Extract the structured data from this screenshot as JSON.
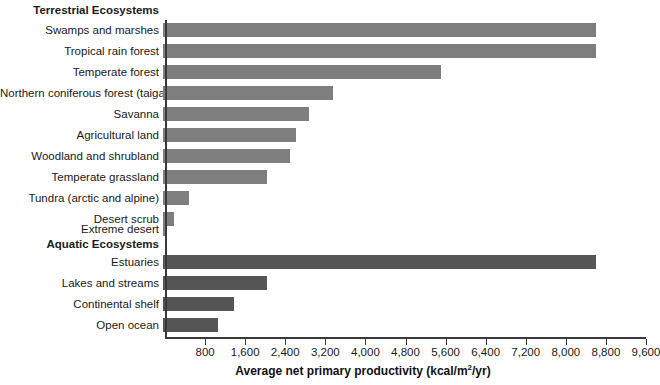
{
  "chart_data": {
    "type": "bar",
    "orientation": "horizontal",
    "title": "",
    "xlabel": "Average net primary productivity (kcal/m2/yr)",
    "xlabel_parts": {
      "before": "Average net primary productivity (kcal/m",
      "sup": "2",
      "after": "/yr)"
    },
    "ylabel": "",
    "xlim": [
      0,
      9600
    ],
    "xtick_step": 800,
    "xticks": [
      800,
      1600,
      2400,
      3200,
      4000,
      4800,
      5600,
      6400,
      7200,
      8000,
      8800,
      9600
    ],
    "xtick_labels": [
      "800",
      "1,600",
      "2,400",
      "3,200",
      "4,000",
      "4,800",
      "5,600",
      "6,400",
      "7,200",
      "8,000",
      "8,800",
      "9,600"
    ],
    "grid": false,
    "legend": "none",
    "groups": [
      {
        "name": "Terrestrial Ecosystems",
        "color": "#7e7e7e",
        "categories": [
          "Swamps and marshes",
          "Tropical rain forest",
          "Temperate forest",
          "Northern coniferous forest (taiga)",
          "Savanna",
          "Agricultural land",
          "Woodland and shrubland",
          "Temperate grassland",
          "Tundra (arctic and alpine)",
          "Desert scrub",
          "Extreme desert"
        ],
        "values": [
          8650,
          8650,
          5550,
          3400,
          2920,
          2650,
          2540,
          2080,
          520,
          220,
          20
        ]
      },
      {
        "name": "Aquatic Ecosystems",
        "color": "#565656",
        "categories": [
          "Estuaries",
          "Lakes and streams",
          "Continental shelf",
          "Open ocean"
        ],
        "values": [
          8650,
          2070,
          1420,
          1100
        ]
      }
    ]
  },
  "colors": {
    "terrestrial_bar": "#7e7e7e",
    "aquatic_bar": "#565656",
    "axis": "#3a3a3a",
    "text": "#1a1a1a",
    "background": "#ffffff"
  }
}
